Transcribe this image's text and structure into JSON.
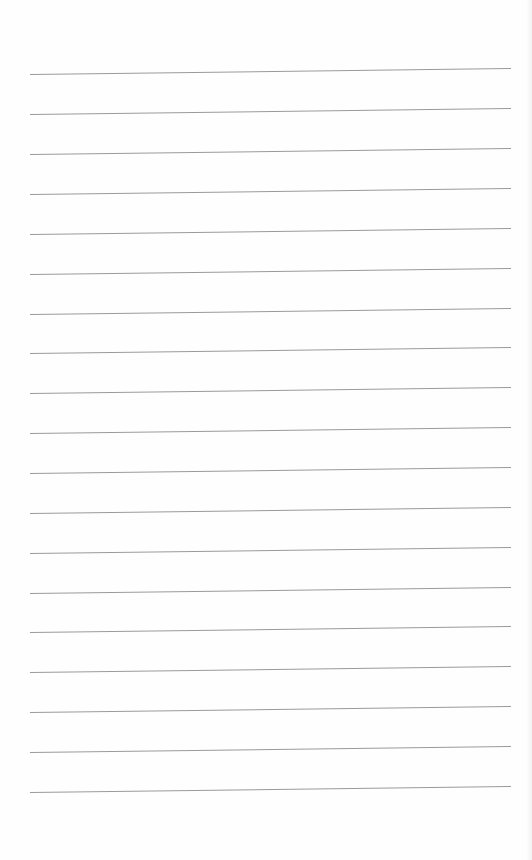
{
  "paper": {
    "type": "lined-paper",
    "background_color": "#fefefe",
    "rule_color": "#9a9a9a",
    "rule_count": 19,
    "rules_y": [
      74,
      114,
      154,
      194,
      234,
      274,
      314,
      353,
      393,
      433,
      473,
      513,
      553,
      593,
      632,
      672,
      712,
      752,
      792
    ]
  }
}
